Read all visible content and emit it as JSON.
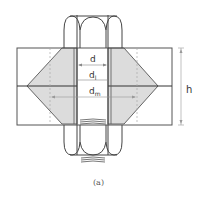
{
  "diagram": {
    "type": "bolted-joint-pressure-cone",
    "labels": {
      "d": "d",
      "dl_main": "d",
      "dl_sub": "l",
      "dm_main": "d",
      "dm_sub": "m",
      "h": "h"
    },
    "caption": "(a)",
    "colors": {
      "line": "#555555",
      "cone_fill": "#d9d9d9",
      "dim_line": "#888888",
      "dashed": "#aaaaaa"
    }
  }
}
